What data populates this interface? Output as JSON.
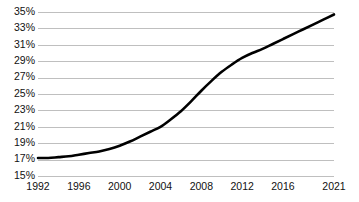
{
  "chart_data": {
    "type": "line",
    "title": "",
    "subtitle": "",
    "xlabel": "",
    "ylabel": "",
    "xlim": [
      1992,
      2021
    ],
    "ylim": [
      15,
      35
    ],
    "grid": true,
    "grid_axis": "y",
    "legend": false,
    "legend_position": "none",
    "line_color": "#000000",
    "grid_color": "#bfbfbf",
    "background_color": "#ffffff",
    "value_suffix": "%",
    "y_ticks": [
      35,
      33,
      31,
      29,
      27,
      25,
      23,
      21,
      19,
      17,
      15
    ],
    "y_tick_labels": [
      "35%",
      "33%",
      "31%",
      "29%",
      "27%",
      "25%",
      "23%",
      "21%",
      "19%",
      "17%",
      "15%"
    ],
    "x_ticks": [
      1992,
      1996,
      2000,
      2004,
      2008,
      2012,
      2016,
      2021
    ],
    "x_tick_labels": [
      "1992",
      "1996",
      "2000",
      "2004",
      "2008",
      "2012",
      "2016",
      "2021"
    ],
    "series": [
      {
        "name": "series-1",
        "color": "#000000",
        "x": [
          1992,
          1993,
          1994,
          1995,
          1996,
          1997,
          1998,
          1999,
          2000,
          2001,
          2002,
          2003,
          2004,
          2005,
          2006,
          2007,
          2008,
          2009,
          2010,
          2011,
          2012,
          2013,
          2014,
          2015,
          2016,
          2017,
          2018,
          2019,
          2020,
          2021
        ],
        "values": [
          17.2,
          17.2,
          17.3,
          17.4,
          17.6,
          17.8,
          18.0,
          18.3,
          18.7,
          19.2,
          19.8,
          20.4,
          21.0,
          21.9,
          22.9,
          24.1,
          25.4,
          26.6,
          27.7,
          28.6,
          29.4,
          30.0,
          30.5,
          31.1,
          31.7,
          32.3,
          32.9,
          33.5,
          34.1,
          34.7
        ]
      }
    ]
  },
  "axes": {
    "y_axis_name": "y-axis",
    "x_axis_name": "x-axis"
  }
}
